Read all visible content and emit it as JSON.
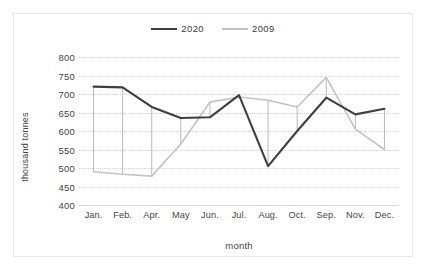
{
  "chart_data": {
    "type": "line",
    "title": "",
    "xlabel": "month",
    "ylabel": "thousand tonnes",
    "ylim": [
      400,
      800
    ],
    "ytick_step": 50,
    "yticks": [
      800,
      750,
      700,
      650,
      600,
      550,
      500,
      450,
      400
    ],
    "grid": true,
    "legend_position": "top-center",
    "categories": [
      "Jan.",
      "Feb.",
      "Apr.",
      "May",
      "Jun.",
      "Jul.",
      "Aug.",
      "Oct.",
      "Sep.",
      "Nov.",
      "Dec."
    ],
    "series": [
      {
        "name": "2020",
        "color": "#3f3f3f",
        "values": [
          720,
          718,
          665,
          635,
          637,
          697,
          505,
          600,
          690,
          645,
          660
        ]
      },
      {
        "name": "2009",
        "color": "#c3c3c3",
        "values": [
          490,
          483,
          478,
          565,
          678,
          692,
          683,
          665,
          745,
          605,
          550
        ]
      }
    ]
  },
  "legend": {
    "entries": [
      {
        "label": "2020"
      },
      {
        "label": "2009"
      }
    ]
  },
  "axes": {
    "y_title": "thousand tonnes",
    "x_title": "month"
  }
}
